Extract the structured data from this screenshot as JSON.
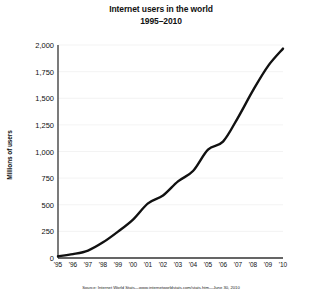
{
  "chart_data": {
    "type": "line",
    "title": "Internet users in the world",
    "subtitle": "1995–2010",
    "xlabel": "",
    "ylabel": "Millions of users",
    "categories": [
      "'95",
      "'96",
      "'97",
      "'98",
      "'99",
      "'00",
      "'01",
      "'02",
      "'03",
      "'04",
      "'05",
      "'06",
      "'07",
      "'08",
      "'09",
      "'10"
    ],
    "x": [
      1995,
      1996,
      1997,
      1998,
      1999,
      2000,
      2001,
      2002,
      2003,
      2004,
      2005,
      2006,
      2007,
      2008,
      2009,
      2010
    ],
    "values": [
      16,
      36,
      70,
      147,
      248,
      361,
      513,
      587,
      719,
      817,
      1018,
      1093,
      1319,
      1574,
      1802,
      1966
    ],
    "ylim": [
      0,
      2000
    ],
    "yticks": [
      0,
      250,
      500,
      750,
      1000,
      1250,
      1500,
      1750,
      2000
    ],
    "ytick_labels": [
      "0",
      "250",
      "500",
      "750",
      "1,000",
      "1,250",
      "1,500",
      "1,750",
      "2,000"
    ],
    "grid": true,
    "grid_axis": "y",
    "legend": false,
    "line_color": "#111111",
    "line_width": 2.4,
    "axis_color": "#333333",
    "background": "#ffffff"
  },
  "source": {
    "note": "Source: Internet World Stats—www.internetworldstats.com/stats.htm—June 30, 2010"
  }
}
